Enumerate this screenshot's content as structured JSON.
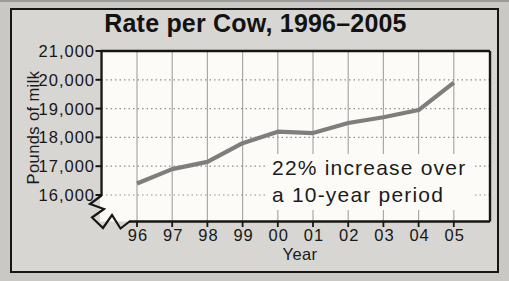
{
  "figure": {
    "annotation": {
      "line1": "22% increase over",
      "line2": "a 10-year period"
    }
  },
  "chart_data": {
    "type": "line",
    "title": "Rate per Cow, 1996–2005",
    "xlabel": "Year",
    "ylabel": "Pounds of milk",
    "categories": [
      "96",
      "97",
      "98",
      "99",
      "00",
      "01",
      "02",
      "03",
      "04",
      "05"
    ],
    "values": [
      16400,
      16900,
      17150,
      17800,
      18200,
      18150,
      18500,
      18700,
      18950,
      19900
    ],
    "ylim": [
      16000,
      21000
    ],
    "y_ticks": {
      "values": [
        16000,
        17000,
        18000,
        19000,
        20000,
        21000
      ],
      "labels": [
        "16,000",
        "17,000",
        "18,000",
        "19,000",
        "20,000",
        "21,000"
      ]
    },
    "axis_break": true,
    "grid": "vertical solid + horizontal dotted",
    "legend": "none",
    "annotation": "22% increase over a 10-year period",
    "colors": {
      "line": "#7e7e7e",
      "axis": "#161616",
      "grid_vertical": "#a9a9a7",
      "grid_horizontal": "#8f8f8d",
      "plot_bg": "#fcfbf7",
      "card_bg": "#d7d6d2",
      "page_bg": "#c9c8c5"
    }
  }
}
